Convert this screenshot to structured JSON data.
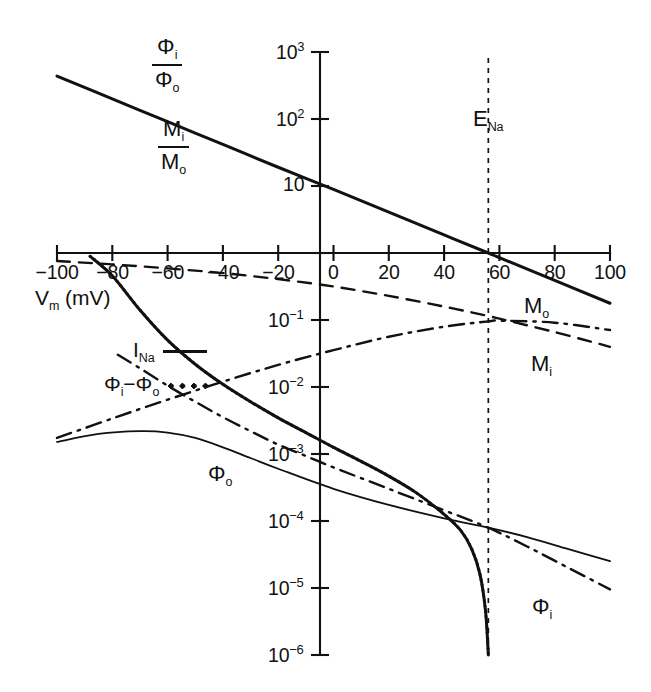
{
  "chart_data": {
    "type": "line",
    "title": "",
    "xlabel": "V_m (mV)",
    "ylabel": "",
    "xlim": [
      -100,
      100
    ],
    "ylim_log10": [
      -6,
      3
    ],
    "grid": false,
    "x_ticks": [
      -100,
      -80,
      -60,
      -40,
      -20,
      0,
      20,
      40,
      60,
      80,
      100
    ],
    "x_tick_labels": [
      "-100",
      "-80",
      "-60",
      "-40",
      "-20",
      "0",
      "20",
      "40",
      "60",
      "80",
      "100"
    ],
    "y_ticks_log10": [
      3,
      2,
      1,
      0,
      -1,
      -2,
      -3,
      -4,
      -5,
      -6
    ],
    "y_tick_labels": [
      "10³",
      "10²",
      "10",
      "",
      "10⁻¹",
      "10⁻²",
      "10⁻³",
      "10⁻⁴",
      "10⁻⁵",
      "10⁻⁶"
    ],
    "annotations": [
      {
        "name": "E_Na",
        "text": "E",
        "sub": "Na",
        "x": 56,
        "style": "vertical-dashed-line"
      }
    ],
    "series": [
      {
        "name": "flux-ratio",
        "label": "Φi/Φo = Mi/Mo",
        "style": "solid-thick",
        "comment": "Ussing flux ratio, log-linear, equals 1 at E_Na = 56 mV",
        "points_x": [
          -100,
          -80,
          -60,
          -40,
          -20,
          0,
          20,
          40,
          56,
          60,
          80,
          100
        ],
        "points_log10y": [
          2.64,
          2.3,
          1.96,
          1.62,
          1.28,
          0.95,
          0.61,
          0.27,
          0.0,
          -0.07,
          -0.41,
          -0.75
        ]
      },
      {
        "name": "M_o",
        "label": "M",
        "sub": "o",
        "style": "dashed",
        "comment": "Outward (efflux) sodium unidirectional flux",
        "points_x": [
          -100,
          -80,
          -60,
          -40,
          -20,
          0,
          20,
          40,
          56,
          60,
          80,
          100
        ],
        "points_log10y": [
          -0.12,
          -0.17,
          -0.23,
          -0.3,
          -0.39,
          -0.5,
          -0.64,
          -0.8,
          -0.94,
          -0.98,
          -1.18,
          -1.4
        ]
      },
      {
        "name": "M_i",
        "label": "M",
        "sub": "i",
        "style": "dashdot",
        "comment": "Inward (influx) sodium unidirectional flux, peaks near E_Na",
        "points_x": [
          -100,
          -80,
          -60,
          -40,
          -20,
          0,
          20,
          40,
          56,
          60,
          80,
          100
        ],
        "points_log10y": [
          -2.76,
          -2.47,
          -2.19,
          -1.92,
          -1.67,
          -1.45,
          -1.25,
          -1.1,
          -1.02,
          -1.01,
          -1.04,
          -1.15
        ]
      },
      {
        "name": "Phi_o",
        "label": "Φ",
        "sub": "o",
        "style": "solid-thin",
        "comment": "Outward GHK flux component, broad maximum near -65 mV",
        "points_x": [
          -100,
          -85,
          -70,
          -60,
          -50,
          -40,
          -30,
          -20,
          0,
          20,
          40,
          56,
          70,
          85,
          100
        ],
        "points_log10y": [
          -2.82,
          -2.7,
          -2.66,
          -2.68,
          -2.76,
          -2.9,
          -3.06,
          -3.22,
          -3.52,
          -3.76,
          -3.96,
          -4.1,
          -4.24,
          -4.42,
          -4.6
        ]
      },
      {
        "name": "Phi_i",
        "label": "Φ",
        "sub": "i",
        "style": "dashdot",
        "comment": "Inward GHK flux component, falls steeply at depolarized potentials",
        "points_x": [
          -78,
          -70,
          -60,
          -50,
          -40,
          -30,
          -20,
          -10,
          0,
          20,
          40,
          56,
          70,
          85,
          100
        ],
        "points_log10y": [
          -1.52,
          -1.72,
          -1.98,
          -2.22,
          -2.45,
          -2.66,
          -2.86,
          -3.03,
          -3.2,
          -3.52,
          -3.84,
          -4.1,
          -4.38,
          -4.7,
          -5.02
        ]
      },
      {
        "name": "I_Na",
        "label": "I",
        "sub": "Na",
        "style": "solid-thick",
        "comment": "Net sodium current; reverses (plunges to zero) at E_Na = 56 mV",
        "points_x": [
          -88,
          -80,
          -70,
          -60,
          -50,
          -40,
          -30,
          -20,
          -10,
          0,
          10,
          20,
          30,
          40,
          46,
          50,
          53,
          55,
          56
        ],
        "points_log10y": [
          -0.05,
          -0.34,
          -0.85,
          -1.3,
          -1.66,
          -1.96,
          -2.22,
          -2.46,
          -2.68,
          -2.9,
          -3.11,
          -3.33,
          -3.58,
          -3.9,
          -4.14,
          -4.42,
          -4.8,
          -5.35,
          -6.0
        ]
      },
      {
        "name": "Phi_i_minus_Phi_o",
        "label": "Φi − Φo",
        "style": "dotted",
        "comment": "Difference of unidirectional fluxes; overlays I_Na",
        "points_x": [
          -88,
          -80,
          -70,
          -60,
          -50,
          -40,
          -30,
          -20,
          -10,
          0,
          10,
          20,
          30,
          40,
          46,
          50,
          53,
          55,
          56
        ],
        "points_log10y": [
          -0.05,
          -0.34,
          -0.85,
          -1.3,
          -1.66,
          -1.96,
          -2.22,
          -2.46,
          -2.68,
          -2.9,
          -3.11,
          -3.33,
          -3.58,
          -3.9,
          -4.14,
          -4.42,
          -4.8,
          -5.35,
          -6.0
        ]
      }
    ],
    "legend": {
      "position": "inner-left",
      "entries": [
        {
          "label": "I",
          "sub": "Na",
          "key": "solid"
        },
        {
          "label": "Φi − Φo",
          "key": "dotted"
        }
      ]
    },
    "corner_labels": [
      {
        "name": "flux-ratio-phi",
        "numerator": "Φi",
        "denominator": "Φo"
      },
      {
        "name": "flux-ratio-m",
        "numerator": "Mi",
        "denominator": "Mo"
      }
    ]
  },
  "axes": {
    "x_label_main": "V",
    "x_label_sub": "m",
    "x_label_unit": " (mV)",
    "x_ticks": [
      {
        "value": "-100",
        "text": "−100"
      },
      {
        "value": "-80",
        "text": "−80"
      },
      {
        "value": "-60",
        "text": "−60"
      },
      {
        "value": "-40",
        "text": "−40"
      },
      {
        "value": "-20",
        "text": "−20"
      },
      {
        "value": "0",
        "text": "0"
      },
      {
        "value": "20",
        "text": "20"
      },
      {
        "value": "40",
        "text": "40"
      },
      {
        "value": "60",
        "text": "60"
      },
      {
        "value": "80",
        "text": "80"
      },
      {
        "value": "100",
        "text": "100"
      }
    ],
    "y_ticks": [
      {
        "mant": "10",
        "exp": "3"
      },
      {
        "mant": "10",
        "exp": "2"
      },
      {
        "mant": "10",
        "exp": ""
      },
      {
        "mant": "10",
        "exp": "−1"
      },
      {
        "mant": "10",
        "exp": "−2"
      },
      {
        "mant": "10",
        "exp": "−3"
      },
      {
        "mant": "10",
        "exp": "−4"
      },
      {
        "mant": "10",
        "exp": "−5"
      },
      {
        "mant": "10",
        "exp": "−6"
      }
    ]
  },
  "labels": {
    "ena_main": "E",
    "ena_sub": "Na",
    "mo_main": "M",
    "mo_sub": "o",
    "mi_main": "M",
    "mi_sub": "i",
    "phio_main": "Φ",
    "phio_sub": "o",
    "phii_main": "Φ",
    "phii_sub": "i",
    "frac1_num_main": "Φ",
    "frac1_num_sub": "i",
    "frac1_den_main": "Φ",
    "frac1_den_sub": "o",
    "frac2_num_main": "M",
    "frac2_num_sub": "i",
    "frac2_den_main": "M",
    "frac2_den_sub": "o",
    "legend1_main": "I",
    "legend1_sub": "Na",
    "legend2_a_main": "Φ",
    "legend2_a_sub": "i",
    "legend2_minus": "−",
    "legend2_b_main": "Φ",
    "legend2_b_sub": "o"
  },
  "colors": {
    "ink": "#111111",
    "background": "#ffffff"
  }
}
